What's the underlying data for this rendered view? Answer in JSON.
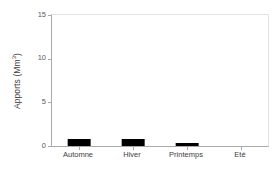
{
  "chart_data": {
    "type": "bar",
    "title": "",
    "xlabel": "",
    "ylabel": "Apports (Mm",
    "ylabel_sup": "3",
    "ylabel_suffix": ")",
    "ylabel_full": "Apports (Mm3)",
    "categories": [
      "Automne",
      "Hiver",
      "Printemps",
      "Eté"
    ],
    "values": [
      0.75,
      0.85,
      0.3,
      0.0
    ],
    "ylim": [
      0,
      15
    ],
    "yticks": [
      0,
      5,
      10,
      15
    ],
    "ytick_labels": [
      "0",
      "5",
      "10",
      "15"
    ],
    "grid": false,
    "legend": null,
    "bar_color": "#000000",
    "axis_color": "#a9a9a9",
    "frame_color": "#e2e2e2",
    "background_color": "#ffffff",
    "text_color": "#3d3d3d"
  }
}
